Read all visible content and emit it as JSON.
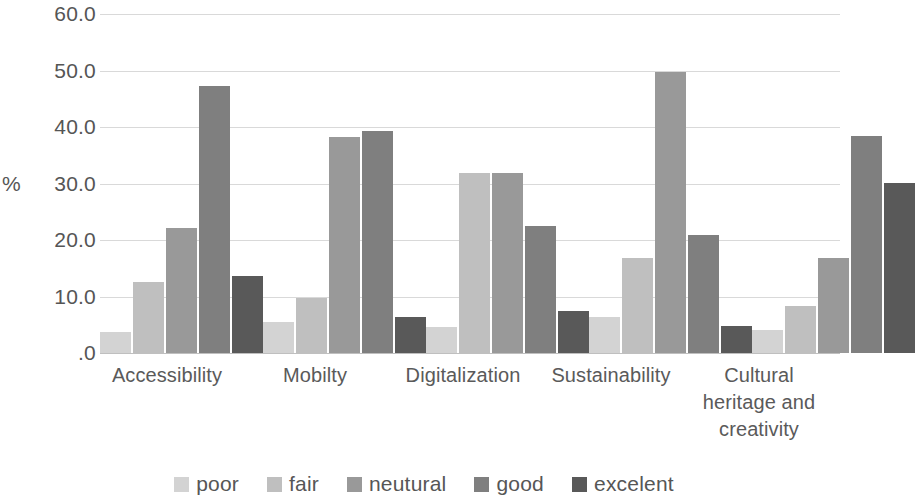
{
  "chart_data": {
    "type": "bar",
    "title": "",
    "xlabel": "",
    "ylabel": "%",
    "ylim": [
      0,
      60
    ],
    "yticks": [
      "60.0",
      "50.0",
      "40.0",
      "30.0",
      "20.0",
      "10.0",
      ".0"
    ],
    "ytick_values": [
      60,
      50,
      40,
      30,
      20,
      10,
      0
    ],
    "grid": true,
    "legend_position": "bottom",
    "categories": [
      "Accessibility",
      "Mobilty",
      "Digitalization",
      "Sustainability",
      "Cultural heritage and creativity"
    ],
    "series": [
      {
        "name": "poor",
        "color": "#d3d3d3",
        "values": [
          3.8,
          5.5,
          4.6,
          6.3,
          4.1
        ]
      },
      {
        "name": "fair",
        "color": "#bfbfbf",
        "values": [
          12.6,
          9.8,
          31.8,
          16.8,
          8.4
        ]
      },
      {
        "name": "neutural",
        "color": "#999999",
        "values": [
          22.2,
          38.3,
          31.8,
          49.8,
          16.8
        ]
      },
      {
        "name": "good",
        "color": "#7f7f7f",
        "values": [
          47.2,
          39.3,
          22.4,
          20.9,
          38.4
        ]
      },
      {
        "name": "excelent",
        "color": "#595959",
        "values": [
          13.7,
          6.4,
          7.4,
          4.7,
          30.1
        ]
      }
    ]
  }
}
